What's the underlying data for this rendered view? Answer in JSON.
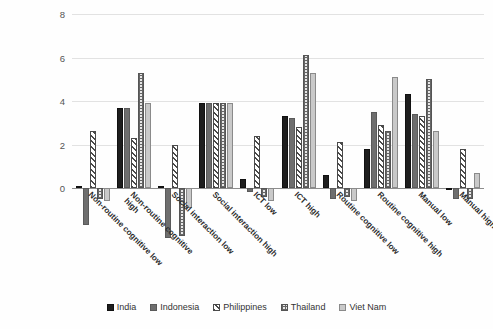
{
  "chart_data": {
    "type": "bar",
    "title": "",
    "xlabel": "",
    "ylabel": "",
    "ylim": [
      -2.6,
      8
    ],
    "yticks": [
      0,
      2,
      4,
      6,
      8
    ],
    "grid": true,
    "legend_position": "bottom",
    "categories": [
      "Non-routine cognitive low",
      "Non-routine cognitive high",
      "Social interaction low",
      "Social interaction high",
      "ICT low",
      "ICT high",
      "Routine cognitive low",
      "Routine cognitive high",
      "Manual low",
      "Manual high"
    ],
    "category_lines": [
      [
        "Non-routine cognitive low",
        ""
      ],
      [
        "Non-routine cognitive",
        "high"
      ],
      [
        "Social interaction low",
        ""
      ],
      [
        "Social interaction high",
        ""
      ],
      [
        "ICT low",
        ""
      ],
      [
        "ICT high",
        ""
      ],
      [
        "Routine cognitive low",
        ""
      ],
      [
        "Routine cognitive high",
        ""
      ],
      [
        "Manual low",
        ""
      ],
      [
        "Manual high",
        ""
      ]
    ],
    "series": [
      {
        "name": "India",
        "pattern": "solid-black",
        "color": "#1e1e1e",
        "values": [
          0.1,
          3.7,
          0.1,
          3.9,
          0.4,
          3.3,
          0.6,
          1.8,
          4.3,
          -0.1
        ]
      },
      {
        "name": "Indonesia",
        "pattern": "solid-grey",
        "color": "#6e6e6e",
        "values": [
          -1.7,
          3.7,
          -2.3,
          3.9,
          -0.2,
          3.2,
          -0.5,
          3.5,
          3.4,
          -0.5
        ]
      },
      {
        "name": "Philippines",
        "pattern": "diagonal-hatch",
        "color": "#4a4a4a",
        "values": [
          2.6,
          2.3,
          2.0,
          3.9,
          2.4,
          2.8,
          2.1,
          2.9,
          3.3,
          1.8
        ]
      },
      {
        "name": "Thailand",
        "pattern": "dotted-grid",
        "color": "#666666",
        "values": [
          -0.5,
          5.3,
          -2.2,
          3.9,
          -0.4,
          6.1,
          -0.4,
          2.6,
          5.0,
          -0.5
        ]
      },
      {
        "name": "Viet Nam",
        "pattern": "solid-light",
        "color": "#c9c9c9",
        "values": [
          -0.6,
          3.9,
          -0.9,
          3.9,
          -0.6,
          5.3,
          -0.6,
          5.1,
          2.6,
          0.7
        ]
      }
    ]
  },
  "legend": {
    "items": [
      "India",
      "Indonesia",
      "Philippines",
      "Thailand",
      "Viet Nam"
    ]
  }
}
